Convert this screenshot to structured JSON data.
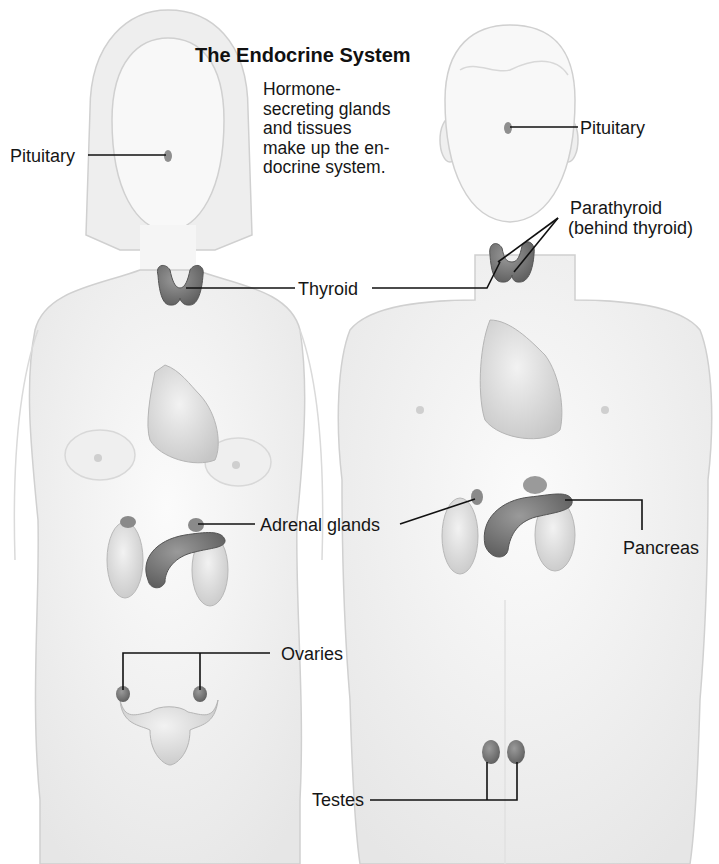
{
  "title": "The Endocrine System",
  "description": [
    "Hormone-",
    "secreting glands",
    "and tissues",
    "make up the en-",
    "docrine system."
  ],
  "labels": {
    "pituitary_left": "Pituitary",
    "pituitary_right": "Pituitary",
    "parathyroid_line1": "Parathyroid",
    "parathyroid_line2": "(behind thyroid)",
    "thyroid": "Thyroid",
    "adrenal": "Adrenal glands",
    "pancreas": "Pancreas",
    "ovaries": "Ovaries",
    "testes": "Testes"
  },
  "figures": [
    {
      "name": "female",
      "organs": [
        "pituitary",
        "thyroid",
        "heart",
        "adrenal glands",
        "kidneys",
        "pancreas",
        "ovaries",
        "uterus"
      ]
    },
    {
      "name": "male",
      "organs": [
        "pituitary",
        "thyroid",
        "parathyroid",
        "heart",
        "adrenal glands",
        "kidneys",
        "pancreas",
        "testes"
      ]
    }
  ],
  "colors": {
    "skin": "#f3f3f3",
    "outline": "#c9c9c9",
    "gland": "#7a7a7a",
    "organ": "#dcdcdc",
    "leader": "#111111"
  }
}
